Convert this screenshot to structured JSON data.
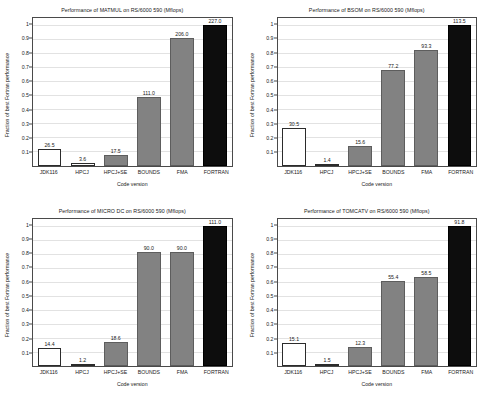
{
  "figure": {
    "background": "#ffffff",
    "bar_colors": {
      "white": "#ffffff",
      "gray": "#828282",
      "black": "#0d0d0d"
    },
    "y_ticks": [
      "0.1",
      "0.2",
      "0.3",
      "0.4",
      "0.5",
      "0.6",
      "0.7",
      "0.8",
      "0.9",
      "1"
    ],
    "categories": [
      "JDK116",
      "HPCJ",
      "HPCJ+SE",
      "BOUNDS",
      "FMA",
      "FORTRAN"
    ],
    "xlabel": "Code version",
    "ylabel": "Fraction of best Fortran performance"
  },
  "chart_data": [
    {
      "type": "bar",
      "title": "Performance of MATMUL on RS/6000 590 (Mflops)",
      "xlabel": "Code version",
      "ylabel": "Fraction of best Fortran performance",
      "categories": [
        "JDK116",
        "HPCJ",
        "HPCJ+SE",
        "BOUNDS",
        "FMA",
        "FORTRAN"
      ],
      "values": [
        26.5,
        3.6,
        17.5,
        111.0,
        206.0,
        227.0
      ],
      "labels": [
        "26.5",
        "3.6",
        "17.5",
        "111.0",
        "206.0",
        "227.0"
      ],
      "fractions": [
        0.117,
        0.016,
        0.077,
        0.489,
        0.907,
        1.0
      ],
      "fills": [
        "white",
        "white",
        "gray",
        "gray",
        "gray",
        "black"
      ],
      "ylim": [
        0,
        1.05
      ],
      "grid": true,
      "legend": "none"
    },
    {
      "type": "bar",
      "title": "Performance of BSOM on RS/6000 590 (Mflops)",
      "xlabel": "Code version",
      "ylabel": "Fraction of best Fortran performance",
      "categories": [
        "JDK116",
        "HPCJ",
        "HPCJ+SE",
        "BOUNDS",
        "FMA",
        "FORTRAN"
      ],
      "values": [
        30.5,
        1.4,
        15.6,
        77.2,
        93.3,
        113.5
      ],
      "labels": [
        "30.5",
        "1.4",
        "15.6",
        "77.2",
        "93.3",
        "113.5"
      ],
      "fractions": [
        0.269,
        0.012,
        0.137,
        0.68,
        0.822,
        1.0
      ],
      "fills": [
        "white",
        "white",
        "gray",
        "gray",
        "gray",
        "black"
      ],
      "ylim": [
        0,
        1.05
      ],
      "grid": true,
      "legend": "none"
    },
    {
      "type": "bar",
      "title": "Performance of MICRO DC on RS/6000 590 (Mflops)",
      "xlabel": "Code version",
      "ylabel": "Fraction of best Fortran performance",
      "categories": [
        "JDK116",
        "HPCJ",
        "HPCJ+SE",
        "BOUNDS",
        "FMA",
        "FORTRAN"
      ],
      "values": [
        14.4,
        1.2,
        18.6,
        90.0,
        90.0,
        111.0
      ],
      "labels": [
        "14.4",
        "1.2",
        "18.6",
        "90.0",
        "90.0",
        "111.0"
      ],
      "fractions": [
        0.13,
        0.011,
        0.168,
        0.811,
        0.811,
        1.0
      ],
      "fills": [
        "white",
        "white",
        "gray",
        "gray",
        "gray",
        "black"
      ],
      "ylim": [
        0,
        1.05
      ],
      "grid": true,
      "legend": "none"
    },
    {
      "type": "bar",
      "title": "Performance of TOMCATV on RS/6000 590 (Mflops)",
      "xlabel": "Code version",
      "ylabel": "Fraction of best Fortran performance",
      "categories": [
        "JDK116",
        "HPCJ",
        "HPCJ+SE",
        "BOUNDS",
        "FMA",
        "FORTRAN"
      ],
      "values": [
        15.1,
        1.5,
        12.3,
        55.4,
        58.5,
        91.8
      ],
      "labels": [
        "15.1",
        "1.5",
        "12.3",
        "55.4",
        "58.5",
        "91.8"
      ],
      "fractions": [
        0.164,
        0.016,
        0.134,
        0.603,
        0.637,
        1.0
      ],
      "fills": [
        "white",
        "white",
        "gray",
        "gray",
        "gray",
        "black"
      ],
      "ylim": [
        0,
        1.05
      ],
      "grid": true,
      "legend": "none"
    }
  ]
}
